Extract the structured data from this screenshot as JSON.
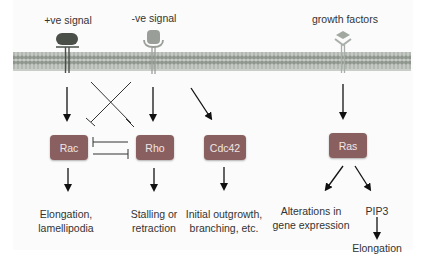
{
  "signals": {
    "positive": "+ve signal",
    "negative": "-ve signal",
    "growth": "growth factors"
  },
  "nodes": {
    "rac": "Rac",
    "rho": "Rho",
    "cdc42": "Cdc42",
    "ras": "Ras"
  },
  "outcomes": {
    "rac_line1": "Elongation,",
    "rac_line2": "lamellipodia",
    "rho_line1": "Stalling or",
    "rho_line2": "retraction",
    "cdc42_line1": "Initial outgrowth,",
    "cdc42_line2": "branching, etc.",
    "ras_gene_line1": "Alterations in",
    "ras_gene_line2": "gene expression",
    "pip3": "PIP3",
    "pip3_outcome": "Elongation"
  },
  "colors": {
    "node_fill": "#8c5a5a",
    "membrane": "#a8b0a8",
    "positive_receptor": "#4a5048",
    "negative_receptor": "#9a9e98",
    "growth_ligand": "#a0a8a0"
  }
}
